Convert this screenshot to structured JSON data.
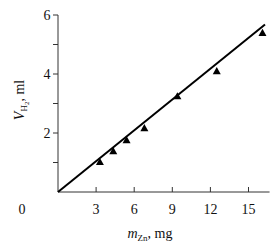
{
  "chart_data": {
    "type": "scatter",
    "title": "",
    "xlabel": "m_Zn, mg",
    "xlabel_parts": {
      "var": "m",
      "sub": "Zn",
      "unit": ", mg"
    },
    "ylabel": "V_H2, ml",
    "ylabel_parts": {
      "var": "V",
      "sub": "H",
      "subsub": "2",
      "unit": ", ml"
    },
    "xlim": [
      0,
      16.5
    ],
    "ylim": [
      0,
      6
    ],
    "x_ticks": [
      0,
      3,
      6,
      9,
      12,
      15
    ],
    "x_tick_labels": [
      "0",
      "3",
      "6",
      "9",
      "12",
      "15"
    ],
    "y_ticks": [
      1,
      2,
      3,
      4,
      5,
      6
    ],
    "y_tick_labels": [
      "",
      "2",
      "",
      "4",
      "",
      "6"
    ],
    "grid": false,
    "legend": null,
    "series": [
      {
        "name": "measured",
        "marker": "triangle",
        "x": [
          3.3,
          4.35,
          5.4,
          6.8,
          9.4,
          12.5,
          16.1
        ],
        "y": [
          1.02,
          1.39,
          1.76,
          2.17,
          3.25,
          4.1,
          5.4
        ]
      },
      {
        "name": "fit line",
        "style": "line",
        "x": [
          0,
          16.3
        ],
        "y": [
          0,
          5.68
        ]
      }
    ]
  }
}
